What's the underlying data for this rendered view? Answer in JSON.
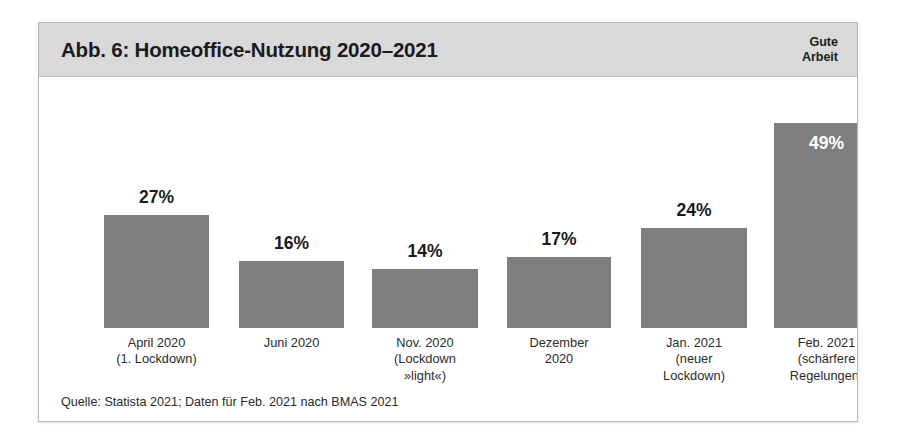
{
  "figure": {
    "title": "Abb. 6: Homeoffice-Nutzung 2020–2021",
    "brand_line1": "Gute",
    "brand_line2": "Arbeit",
    "source": "Quelle: Statista 2021; Daten für Feb. 2021 nach BMAS 2021"
  },
  "colors": {
    "header_band": "#d9d9d9",
    "bar_fill": "#7f7f7f",
    "frame_border": "#b9b9b9",
    "text": "#1b1b1b",
    "value_inside": "#ffffff"
  },
  "chart_data": {
    "type": "bar",
    "title": "Abb. 6: Homeoffice-Nutzung 2020–2021",
    "xlabel": "",
    "ylabel": "",
    "ylim": [
      0,
      55
    ],
    "grid": false,
    "legend": false,
    "value_suffix": "%",
    "categories": [
      "April 2020 (1. Lockdown)",
      "Juni 2020",
      "Nov. 2020 (Lockdown »light«)",
      "Dezember 2020",
      "Jan. 2021 (neuer Lockdown)",
      "Feb. 2021 (schärfere Regelungen)"
    ],
    "values": [
      27,
      16,
      14,
      17,
      24,
      49
    ],
    "value_labels": [
      "27%",
      "16%",
      "14%",
      "17%",
      "24%",
      "49%"
    ],
    "tick_label_lines": [
      [
        "April 2020",
        "(1. Lockdown)"
      ],
      [
        "Juni 2020"
      ],
      [
        "Nov. 2020",
        "(Lockdown",
        "»light«)"
      ],
      [
        "Dezember",
        "2020"
      ],
      [
        "Jan. 2021",
        "(neuer",
        "Lockdown)"
      ],
      [
        "Feb. 2021",
        "(schärfere",
        "Regelungen)"
      ]
    ],
    "annotations": [
      "Quelle: Statista 2021; Daten für Feb. 2021 nach BMAS 2021"
    ]
  },
  "bars": [
    {
      "value_label": "27%",
      "l1": "April 2020",
      "l2": "(1. Lockdown)",
      "l3": ""
    },
    {
      "value_label": "16%",
      "l1": "Juni 2020",
      "l2": "",
      "l3": ""
    },
    {
      "value_label": "14%",
      "l1": "Nov. 2020",
      "l2": "(Lockdown",
      "l3": "»light«)"
    },
    {
      "value_label": "17%",
      "l1": "Dezember",
      "l2": "2020",
      "l3": ""
    },
    {
      "value_label": "24%",
      "l1": "Jan. 2021",
      "l2": "(neuer",
      "l3": "Lockdown)"
    },
    {
      "value_label": "49%",
      "l1": "Feb. 2021",
      "l2": "(schärfere",
      "l3": "Regelungen)"
    }
  ]
}
